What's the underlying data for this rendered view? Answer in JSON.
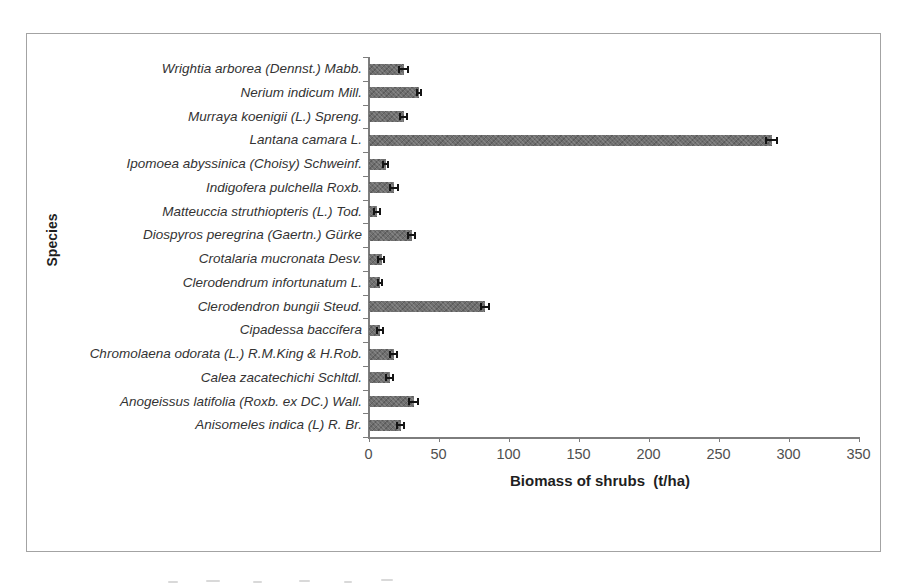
{
  "chart_data": {
    "type": "bar",
    "orientation": "horizontal",
    "title": "",
    "xlabel": "Biomass of shrubs  (t/ha)",
    "ylabel": "Species",
    "xlim": [
      0,
      350
    ],
    "xticks": [
      0,
      50,
      100,
      150,
      200,
      250,
      300,
      350
    ],
    "grid": false,
    "legend": "none",
    "bar_color": "#6f6f6f",
    "error_bar_color": "#141414",
    "axis_color": "#7d7d7d",
    "figure_border_color": "#a3a3a3",
    "label_color": "#333333",
    "categories": [
      "Wrightia arborea (Dennst.) Mabb.",
      "Nerium indicum Mill.",
      "Murraya koenigii (L.) Spreng.",
      "Lantana camara L.",
      "Ipomoea abyssinica (Choisy) Schweinf.",
      "Indigofera pulchella Roxb.",
      "Matteuccia struthiopteris (L.) Tod.",
      "Diospyros peregrina (Gaertn.) Gürke",
      "Crotalaria mucronata Desv.",
      "Clerodendrum infortunatum L.",
      "Clerodendron bungii Steud.",
      "Cipadessa baccifera",
      "Chromolaena odorata (L.) R.M.King & H.Rob.",
      "Calea zacatechichi Schltdl.",
      "Anogeissus latifolia (Roxb. ex DC.) Wall.",
      "Anisomeles indica (L) R. Br."
    ],
    "values": [
      25,
      36,
      25,
      288,
      12,
      18,
      6,
      31,
      9,
      8,
      83,
      8,
      18,
      15,
      32,
      23
    ],
    "errors": [
      3,
      1.5,
      2.5,
      4,
      2,
      3,
      2,
      2.5,
      2,
      1.5,
      3,
      2,
      2.5,
      2.5,
      3,
      2.5
    ]
  }
}
